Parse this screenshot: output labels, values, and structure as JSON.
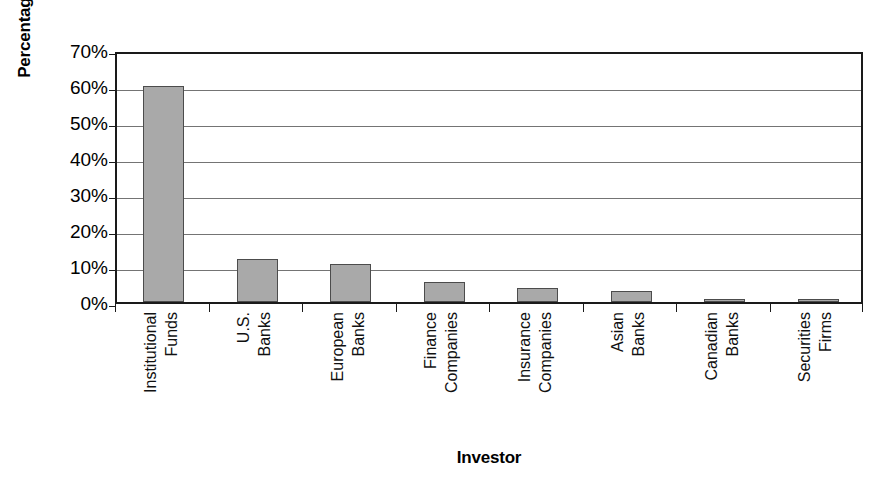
{
  "chart_data": {
    "type": "bar",
    "title": "",
    "xlabel": "Investor",
    "ylabel": "Percentage",
    "categories": [
      "Institutional Funds",
      "U.S. Banks",
      "European Banks",
      "Finance Companies",
      "Insurance Companies",
      "Asian Banks",
      "Canadian Banks",
      "Securities Firms"
    ],
    "category_lines": [
      [
        "Institutional",
        "Funds"
      ],
      [
        "U.S.",
        "Banks"
      ],
      [
        "European",
        "Banks"
      ],
      [
        "Finance",
        "Companies"
      ],
      [
        "Insurance",
        "Companies"
      ],
      [
        "Asian",
        "Banks"
      ],
      [
        "Canadian",
        "Banks"
      ],
      [
        "Securities",
        "Firms"
      ]
    ],
    "values": [
      60,
      12,
      10.5,
      5.5,
      4,
      3,
      0.6,
      0.5
    ],
    "ylim": [
      0,
      70
    ],
    "ytick_values": [
      0,
      10,
      20,
      30,
      40,
      50,
      60,
      70
    ],
    "ytick_labels": [
      "0%",
      "10%",
      "20%",
      "30%",
      "40%",
      "50%",
      "60%",
      "70%"
    ],
    "grid": true,
    "grid_axis": "y",
    "legend": "none",
    "bar_fill_color": "#a9a9a9",
    "bar_edge_color": "#4c4c4c",
    "gridline_color": "#747474",
    "frame_color": "#1a1a1a",
    "background_color": "#ffffff"
  },
  "caption": {
    "partial_text": ""
  }
}
